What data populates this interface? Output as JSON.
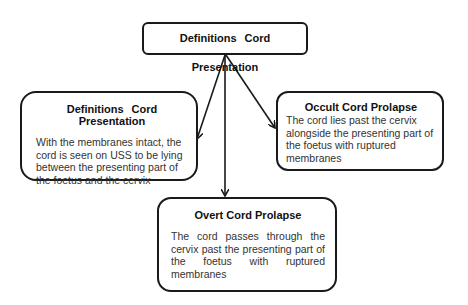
{
  "diagram": {
    "root": {
      "title": "Definitions   Cord Presentation"
    },
    "children": [
      {
        "id": "cord-presentation",
        "title": "Definitions   Cord Presentation",
        "text": "With the membranes intact, the cord is seen on USS to be lying between the presenting part of the foetus and the cervix"
      },
      {
        "id": "occult-cord-prolapse",
        "title": "Occult Cord Prolapse",
        "text": "The cord lies past the cervix alongside the presenting part of the foetus with ruptured membranes"
      },
      {
        "id": "overt-cord-prolapse",
        "title": "Overt Cord Prolapse",
        "text": "The cord passes through the cervix past the presenting part of the foetus with ruptured membranes"
      }
    ],
    "edges": [
      {
        "from": "root",
        "to": "cord-presentation"
      },
      {
        "from": "root",
        "to": "overt-cord-prolapse"
      },
      {
        "from": "root",
        "to": "occult-cord-prolapse"
      }
    ],
    "colors": {
      "stroke": "#1a1a1a",
      "background": "#ffffff",
      "text": "#333333"
    }
  }
}
